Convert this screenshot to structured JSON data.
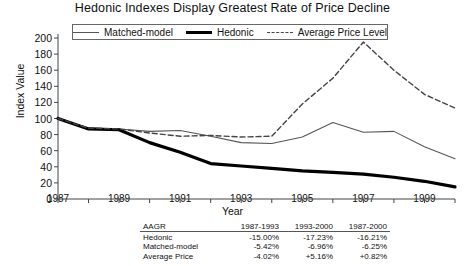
{
  "chart_data": {
    "type": "line",
    "title": "Hedonic Indexes Display Greatest Rate of Price Decline",
    "xlabel": "Year",
    "ylabel": "Index Value",
    "ylim": [
      0,
      200
    ],
    "yticks": [
      0,
      20,
      40,
      60,
      80,
      100,
      120,
      140,
      160,
      180,
      200
    ],
    "xlim": [
      1987,
      2000
    ],
    "xticks": [
      1987,
      1989,
      1991,
      1993,
      1995,
      1997,
      1999
    ],
    "x": [
      1987,
      1988,
      1989,
      1990,
      1991,
      1992,
      1993,
      1994,
      1995,
      1996,
      1997,
      1998,
      1999,
      2000
    ],
    "grid": false,
    "legend_position": "top",
    "series": [
      {
        "name": "Matched-model",
        "style": "thin-solid",
        "color": "#555555",
        "values": [
          100,
          88,
          87,
          84,
          85,
          78,
          70,
          69,
          77,
          95,
          83,
          84,
          65,
          50
        ]
      },
      {
        "name": "Hedonic",
        "style": "bold-solid",
        "color": "#000000",
        "values": [
          100,
          87,
          86,
          70,
          58,
          44,
          41,
          38,
          35,
          33,
          31,
          27,
          22,
          15
        ]
      },
      {
        "name": "Average Price Level",
        "style": "dashed",
        "color": "#444444",
        "values": [
          100,
          88,
          87,
          82,
          78,
          79,
          77,
          78,
          118,
          150,
          195,
          160,
          130,
          113
        ]
      }
    ]
  },
  "table": {
    "headers": [
      "AAGR",
      "1987-1993",
      "1993-2000",
      "1987-2000"
    ],
    "rows": [
      {
        "label": "Hedonic",
        "v1": "-15.00%",
        "v2": "-17.23%",
        "v3": "-16.21%"
      },
      {
        "label": "Matched-model",
        "v1": "-5.42%",
        "v2": "-6.96%",
        "v3": "-6.25%"
      },
      {
        "label": "Average Price",
        "v1": "-4.02%",
        "v2": "+5.16%",
        "v3": "+0.82%"
      }
    ]
  }
}
